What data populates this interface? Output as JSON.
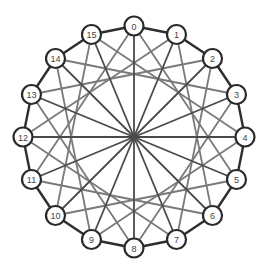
{
  "diagram": {
    "type": "graph",
    "center": [
      134,
      137
    ],
    "radius": 111,
    "node_radius": 9.5,
    "colors": {
      "ring": "#2e2e2e",
      "spoke": "#4a4a4a",
      "chord": "#7a7a7a",
      "node_stroke": "#2a2a2a",
      "node_fill": "#ffffff",
      "label": "#444444"
    },
    "nodes": [
      {
        "id": "0",
        "x": 134,
        "y": 26
      },
      {
        "id": "1",
        "x": 176.5,
        "y": 34.5
      },
      {
        "id": "2",
        "x": 212.5,
        "y": 58.5
      },
      {
        "id": "3",
        "x": 236.5,
        "y": 94.5
      },
      {
        "id": "4",
        "x": 245,
        "y": 137
      },
      {
        "id": "5",
        "x": 236.5,
        "y": 179.5
      },
      {
        "id": "6",
        "x": 212.5,
        "y": 215.5
      },
      {
        "id": "7",
        "x": 176.5,
        "y": 239.5
      },
      {
        "id": "8",
        "x": 134,
        "y": 248
      },
      {
        "id": "9",
        "x": 91.5,
        "y": 239.5
      },
      {
        "id": "10",
        "x": 55.5,
        "y": 215.5
      },
      {
        "id": "11",
        "x": 31.5,
        "y": 179.5
      },
      {
        "id": "12",
        "x": 23,
        "y": 137
      },
      {
        "id": "13",
        "x": 31.5,
        "y": 94.5
      },
      {
        "id": "14",
        "x": 55.5,
        "y": 58.5
      },
      {
        "id": "15",
        "x": 91.5,
        "y": 34.5
      }
    ],
    "ring_step": 1,
    "chord_step": 5,
    "hub": true
  }
}
